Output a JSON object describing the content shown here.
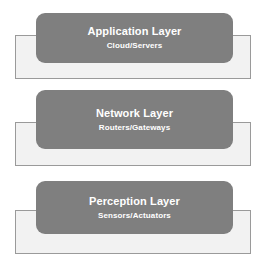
{
  "diagram": {
    "name": "iot-three-layer-architecture",
    "background_color": "#ffffff",
    "card_color": "#7f7f7f",
    "plate_color": "#f2f2f2",
    "plate_border_color": "#9a9a9a",
    "text_color": "#ffffff"
  },
  "layers": [
    {
      "id": "application",
      "title": "Application Layer",
      "subtitle": "Cloud/Servers"
    },
    {
      "id": "network",
      "title": "Network Layer",
      "subtitle": "Routers/Gateways"
    },
    {
      "id": "perception",
      "title": "Perception Layer",
      "subtitle": "Sensors/Actuators"
    }
  ]
}
